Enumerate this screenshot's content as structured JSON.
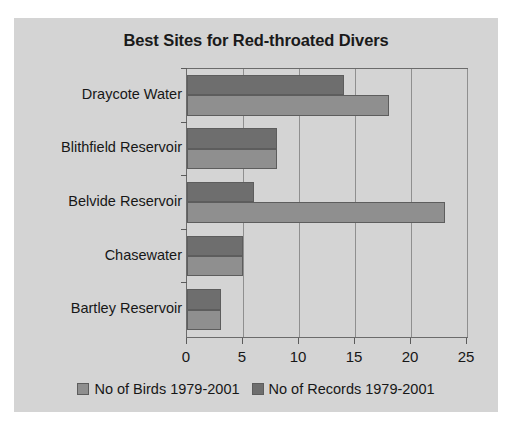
{
  "chart_data": {
    "type": "bar",
    "orientation": "horizontal",
    "title": "Best Sites for Red-throated Divers",
    "xlabel": "",
    "ylabel": "",
    "categories": [
      "Draycote Water",
      "Blithfield Reservoir",
      "Belvide Reservoir",
      "Chasewater",
      "Bartley Reservoir"
    ],
    "series": [
      {
        "name": "No of Birds 1979-2001",
        "color": "#8f8f8f",
        "values": [
          18,
          8,
          23,
          5,
          3
        ]
      },
      {
        "name": "No of Records 1979-2001",
        "color": "#6e6e6e",
        "values": [
          14,
          8,
          6,
          5,
          3
        ]
      }
    ],
    "xlim": [
      0,
      25
    ],
    "xticks": [
      0,
      5,
      10,
      15,
      20,
      25
    ],
    "xtick_labels": [
      "0",
      "5",
      "10",
      "15",
      "20",
      "25"
    ],
    "grid": "vertical",
    "legend_position": "bottom",
    "background_color": "#d4d4d4",
    "plot_border_color": "#6b6b6b"
  }
}
